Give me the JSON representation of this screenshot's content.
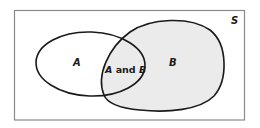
{
  "diagram": {
    "type": "venn",
    "universe": {
      "label": "S",
      "border_color": "#8a8a8a",
      "fill_color": "#ffffff"
    },
    "sets": [
      {
        "id": "A",
        "label": "A",
        "fill_color": "#ffffff",
        "stroke_color": "#1a1a1a"
      },
      {
        "id": "B",
        "label": "B",
        "fill_color": "#ebebeb",
        "stroke_color": "#1a1a1a"
      }
    ],
    "intersection": {
      "label_parts": [
        "A",
        " and ",
        "B"
      ],
      "label": "A and B"
    }
  }
}
